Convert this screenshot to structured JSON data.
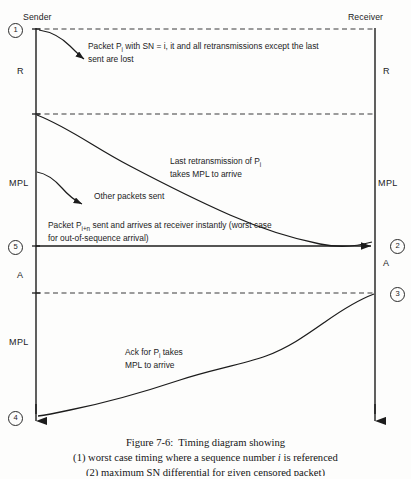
{
  "figure": {
    "endpoints": {
      "sender_label": "Sender",
      "receiver_label": "Receiver"
    },
    "interval_labels": {
      "left_r": "R",
      "right_r": "R",
      "left_mpl_upper": "MPL",
      "right_mpl_upper": "MPL",
      "left_a": "A",
      "right_a": "A",
      "left_mpl_lower": "MPL"
    },
    "markers": [
      {
        "id": "1",
        "label": "1",
        "side": "left"
      },
      {
        "id": "5",
        "label": "5",
        "side": "left"
      },
      {
        "id": "4",
        "label": "4",
        "side": "left"
      },
      {
        "id": "2",
        "label": "2",
        "side": "right"
      },
      {
        "id": "3",
        "label": "3",
        "side": "right"
      }
    ],
    "annotations": {
      "packet_loss": {
        "line1_pre": "Packet P",
        "line1_sub": "i",
        "line1_post": " with SN = i, it and all retransmissions except the last",
        "line2": "sent are lost"
      },
      "last_retransmission": {
        "line1_pre": "Last retransmission of P",
        "line1_sub": "i",
        "line2": "takes MPL to arrive"
      },
      "other_packets": {
        "text": "Other packets sent"
      },
      "out_of_sequence": {
        "line1_pre": "Packet P",
        "line1_sub": "i+n",
        "line1_post": " sent and arrives at receiver instantly (worst case",
        "line2": "for out-of-sequence arrival)"
      },
      "ack": {
        "line1_pre": "Ack for P",
        "line1_sub": "i",
        "line1_post": " takes",
        "line2": "MPL to arrive"
      }
    },
    "caption": {
      "line1": "Figure 7-6:  Timing diagram showing",
      "line2_pre": "(1) worst case timing where a sequence number ",
      "line2_em": "i",
      "line2_post": " is referenced",
      "line3": "(2) maximum SN differential for given censored packet)"
    },
    "colors": {
      "ink": "#1c1c1c",
      "paper": "#fdfdfc",
      "dashed": "#3a3a3a"
    }
  }
}
